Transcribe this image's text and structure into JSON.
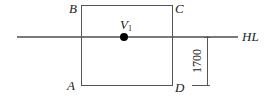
{
  "diagram": {
    "corners": {
      "top_left": "B",
      "top_right": "C",
      "bottom_left": "A",
      "bottom_right": "D"
    },
    "point": {
      "label": "V",
      "subscript": "1"
    },
    "line_label": "HL",
    "dimension_value": "1700",
    "colors": {
      "line": "#555555",
      "dot": "#000000",
      "text": "#222222"
    }
  }
}
